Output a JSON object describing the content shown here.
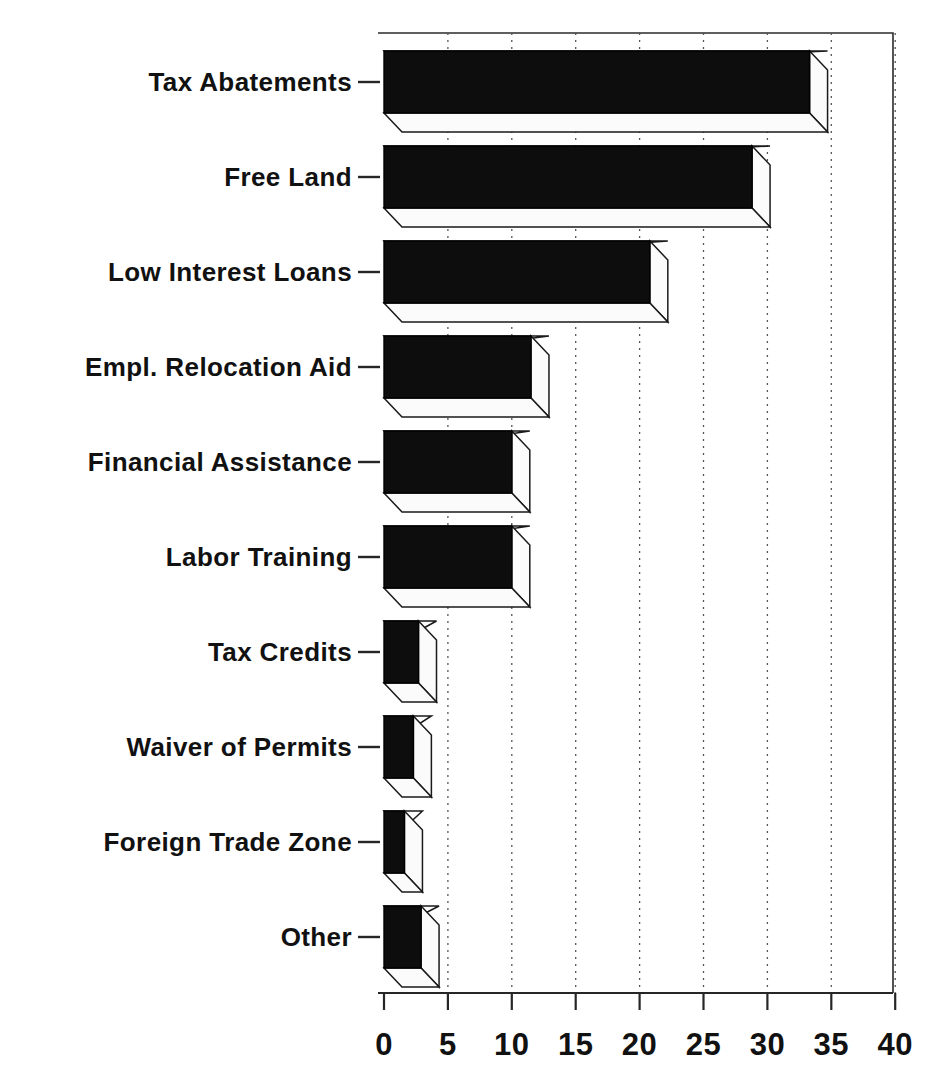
{
  "chart_data": {
    "type": "bar",
    "orientation": "horizontal",
    "title": "",
    "subtitle": "",
    "xlabel": "",
    "ylabel": "",
    "xlim": [
      0,
      40
    ],
    "ylim": null,
    "grid": true,
    "grid_axis": "x",
    "legend": false,
    "legend_position": "none",
    "style": "3d-shaded-black-bars",
    "categories": [
      "Tax Abatements",
      "Free Land",
      "Low Interest Loans",
      "Empl. Relocation Aid",
      "Financial Assistance",
      "Labor Training",
      "Tax Credits",
      "Waiver of Permits",
      "Foreign Trade Zone",
      "Other"
    ],
    "values": [
      33.3,
      28.8,
      20.8,
      11.5,
      10.0,
      10.0,
      2.7,
      2.3,
      1.6,
      2.9
    ],
    "xticks": [
      0,
      5,
      10,
      15,
      20,
      25,
      30,
      35,
      40
    ],
    "xtick_labels": [
      "0",
      "5",
      "10",
      "15",
      "20",
      "25",
      "30",
      "35",
      "40"
    ],
    "series": [
      {
        "name": "",
        "values": [
          33.3,
          28.8,
          20.8,
          11.5,
          10.0,
          10.0,
          2.7,
          2.3,
          1.6,
          2.9
        ]
      }
    ],
    "colors": {
      "bar_front": "#0d0d0d",
      "bar_side": "#fbfbfb",
      "bar_top": "#fdfdfd",
      "axis": "#262626",
      "grid": "#555555",
      "text": "#111111",
      "background": "#ffffff"
    }
  },
  "axes": {
    "x_axis_name": "x-axis",
    "y_axis_name": "y-axis-categories"
  }
}
